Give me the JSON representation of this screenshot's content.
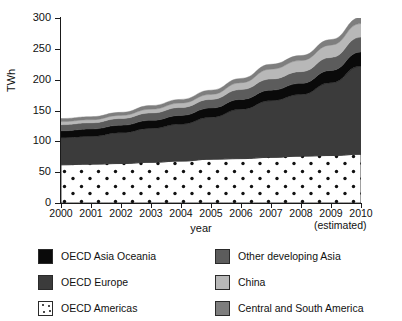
{
  "chart_data": {
    "type": "area",
    "title": "",
    "subtitle": "",
    "xlabel": "year",
    "ylabel": "TWh",
    "x": [
      2000,
      2001,
      2002,
      2003,
      2004,
      2005,
      2006,
      2007,
      2008,
      2009,
      2010
    ],
    "x_tick_labels": [
      "2000",
      "2001",
      "2002",
      "2003",
      "2004",
      "2005",
      "2006",
      "2007",
      "2008",
      "2009",
      "2010"
    ],
    "x_note": "(estimated)",
    "y_tick_labels": [
      "0",
      "50",
      "100",
      "150",
      "200",
      "250",
      "300"
    ],
    "y_ticks": [
      0,
      50,
      100,
      150,
      200,
      250,
      300
    ],
    "ylim": [
      0,
      300
    ],
    "xlim": [
      2000,
      2010
    ],
    "grid": false,
    "stacked": true,
    "legend_position": "bottom",
    "series": [
      {
        "name": "OECD Americas",
        "color": "#ffffff",
        "pattern": "dots",
        "values": [
          62,
          63,
          64,
          66,
          68,
          71,
          72,
          74,
          76,
          77,
          79
        ]
      },
      {
        "name": "OECD Europe",
        "color": "#3b3b3b",
        "values": [
          44,
          45,
          50,
          55,
          60,
          68,
          80,
          92,
          100,
          118,
          143
        ]
      },
      {
        "name": "OECD Asia Oceania",
        "color": "#0a0a0a",
        "values": [
          11,
          12,
          12,
          13,
          14,
          15,
          16,
          17,
          18,
          20,
          23
        ]
      },
      {
        "name": "Other developing Asia",
        "color": "#5c5c5c",
        "values": [
          10,
          10,
          11,
          12,
          13,
          14,
          16,
          18,
          19,
          21,
          24
        ]
      },
      {
        "name": "China",
        "color": "#b8b8b8",
        "values": [
          5,
          5,
          5,
          6,
          7,
          8,
          11,
          16,
          18,
          20,
          22
        ]
      },
      {
        "name": "Central and South America",
        "color": "#7e7e7e",
        "values": [
          5,
          5,
          5,
          6,
          6,
          7,
          7,
          8,
          8,
          9,
          10
        ]
      }
    ],
    "totals": [
      137,
      140,
      147,
      158,
      168,
      183,
      202,
      225,
      239,
      265,
      301
    ]
  },
  "axes": {
    "y_label": "TWh",
    "x_label": "year",
    "x_estimated_note": "(estimated)"
  },
  "legend": {
    "left_column": [
      {
        "label": "OECD Asia Oceania",
        "color": "#0a0a0a",
        "pattern": "solid"
      },
      {
        "label": "OECD Europe",
        "color": "#3b3b3b",
        "pattern": "solid"
      },
      {
        "label": "OECD Americas",
        "color": "#ffffff",
        "pattern": "dots"
      }
    ],
    "right_column": [
      {
        "label": "Other developing Asia",
        "color": "#5c5c5c",
        "pattern": "solid"
      },
      {
        "label": "China",
        "color": "#b8b8b8",
        "pattern": "solid"
      },
      {
        "label": "Central and South America",
        "color": "#7e7e7e",
        "pattern": "solid"
      }
    ]
  }
}
